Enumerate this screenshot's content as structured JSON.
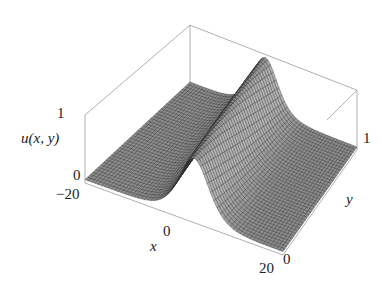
{
  "chart_data": {
    "type": "surface3d",
    "title": "",
    "zlabel": "u(x, y)",
    "xlabel": "x",
    "ylabel": "y",
    "x_ticks": [
      "-20",
      "0",
      "20"
    ],
    "y_ticks": [
      "0",
      "1"
    ],
    "z_ticks": [
      "0",
      "1"
    ],
    "x_range": [
      -20,
      20
    ],
    "y_range": [
      0,
      1
    ],
    "z_range": [
      0,
      1
    ],
    "ridge": {
      "center_x_at_y0": 2,
      "center_x_at_y1": -2,
      "peak_u": 0.95,
      "width": 4
    },
    "mesh": {
      "x_lines": 60,
      "y_lines": 40
    },
    "surface_color": "#8a8a8a",
    "mesh_color": "#2a2a2a",
    "box_color": "#9a9a9a",
    "grid": false
  },
  "labels": {
    "z_top": "1",
    "z_bottom": "0",
    "z_axis": "u(x, y)",
    "x_min": "-20",
    "x_mid": "0",
    "x_max": "20",
    "x_axis": "x",
    "y_min": "0",
    "y_max": "1",
    "y_axis": "y"
  }
}
